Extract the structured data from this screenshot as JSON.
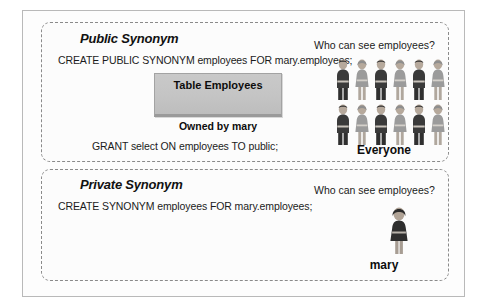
{
  "diagram": {
    "type": "concept-diagram",
    "panels": [
      {
        "id": "public",
        "title": "Public Synonym",
        "sql_statement": "CREATE PUBLIC SYNONYM employees FOR mary.employees;",
        "grant_statement": "GRANT select ON employees TO public;",
        "table_label": "Table Employees",
        "owner_label": "Owned by mary",
        "question": "Who can see employees?",
        "answer_caption": "Everyone",
        "people_rows": 2,
        "people_per_row": 6,
        "people_total": 12,
        "people_pattern": [
          "male",
          "female",
          "male",
          "female",
          "male",
          "female"
        ]
      },
      {
        "id": "private",
        "title": "Private Synonym",
        "sql_statement": "CREATE SYNONYM employees FOR mary.employees;",
        "question": "Who can see employees?",
        "answer_caption": "mary",
        "people_total": 1,
        "people_pattern": [
          "female"
        ]
      }
    ],
    "colors": {
      "frame_border": "#b9b9b9",
      "panel_border": "#8a8a8a",
      "table_fill": "#c4c4c4",
      "table_border": "#a3a3a3",
      "male_figure": "#3a3a3a",
      "female_figure": "#9b9b9b",
      "skin": "#bdb0a4",
      "text": "#1b1b1b",
      "background": "#ffffff"
    }
  }
}
